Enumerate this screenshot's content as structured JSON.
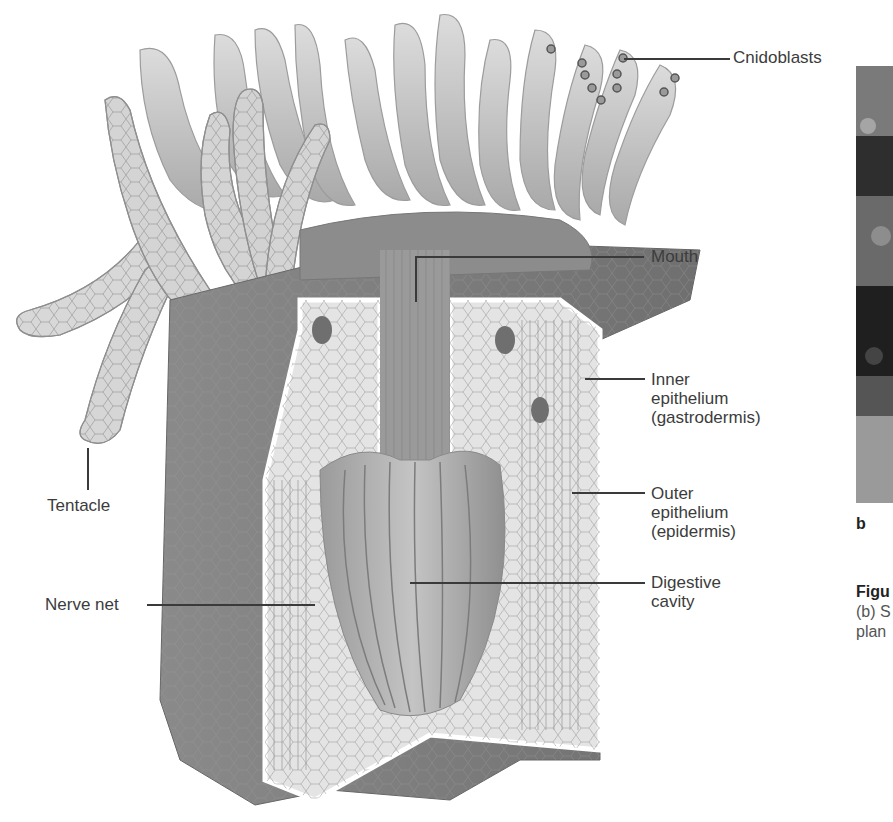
{
  "figure": {
    "labels": {
      "cnidoblasts": "Cnidoblasts",
      "mouth": "Mouth",
      "inner_epithelium": "Inner\nepithelium\n(gastrodermis)",
      "outer_epithelium": "Outer\nepithelium\n(epidermis)",
      "digestive_cavity": "Digestive\ncavity",
      "tentacle": "Tentacle",
      "nerve_net": "Nerve net"
    }
  },
  "side_panel": {
    "panel_letter": "b",
    "caption_bold": "Figu",
    "caption_line1": "(b) S",
    "caption_line2": "plan"
  },
  "colors": {
    "background": "#ffffff",
    "label_text": "#3c3c3c",
    "body_dark": "#7d7d7d",
    "body_light": "#d9d9d9",
    "tentacle_fill": "#e2e2e2"
  }
}
